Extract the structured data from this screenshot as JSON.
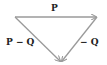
{
  "diagram": {
    "type": "vector-triangle",
    "colors": {
      "arrow": "#9a9a9a",
      "text": "#222222",
      "background": "#ffffff"
    },
    "vectors": [
      {
        "label": "P",
        "from": "top-left",
        "to": "top-right"
      },
      {
        "label": "− Q",
        "from": "top-right",
        "to": "bottom"
      },
      {
        "label": "P − Q",
        "from": "top-left",
        "to": "bottom"
      }
    ],
    "labels": {
      "p": "P",
      "minus_q": "− Q",
      "p_minus_q": "P − Q"
    }
  }
}
